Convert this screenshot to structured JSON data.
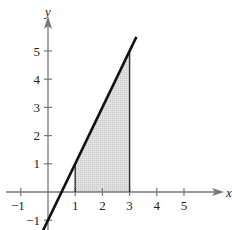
{
  "chart_data": {
    "type": "line",
    "title": "",
    "xlabel": "x",
    "ylabel": "y",
    "function": "y = 2x - 1",
    "series": [
      {
        "name": "y = 2x - 1",
        "x": [
          -0.2,
          3.25
        ],
        "y": [
          -1.4,
          5.5
        ]
      }
    ],
    "shaded_region": {
      "x_from": 1,
      "x_to": 3,
      "under": "y = 2x - 1",
      "above": "x-axis",
      "color": "#d4d4d4"
    },
    "vertical_lines": [
      {
        "x": 1,
        "y_top": 1
      },
      {
        "x": 3,
        "y_top": 5
      }
    ],
    "x_ticks": [
      -1,
      1,
      2,
      3,
      4,
      5
    ],
    "y_ticks": [
      -1,
      1,
      2,
      3,
      4,
      5
    ],
    "xlim": [
      -1.5,
      5.8
    ],
    "ylim": [
      -1.4,
      6.5
    ],
    "grid": false,
    "legend": null
  },
  "labels": {
    "x_axis": "x",
    "y_axis": "y",
    "x_tick_labels": [
      "−1",
      "1",
      "2",
      "3",
      "4",
      "5"
    ],
    "y_tick_labels": [
      "−1",
      "1",
      "2",
      "3",
      "4",
      "5"
    ]
  }
}
